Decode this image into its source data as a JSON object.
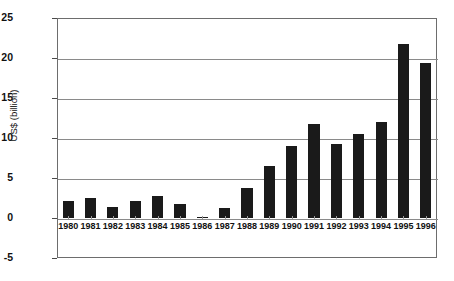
{
  "chart_data": {
    "type": "bar",
    "title": "",
    "xlabel": "",
    "ylabel": "US$ (billion)",
    "ylim": [
      -5,
      25
    ],
    "yticks": [
      25,
      20,
      15,
      10,
      5,
      0,
      -5
    ],
    "ytick_labels": [
      "25",
      "20",
      "15",
      "10",
      "5",
      "0",
      "-5"
    ],
    "grid": true,
    "legend": "none",
    "bar_color": "#1a1a1a",
    "categories": [
      "1980",
      "1981",
      "1982",
      "1983",
      "1984",
      "1985",
      "1986",
      "1987",
      "1988",
      "1989",
      "1990",
      "1991",
      "1992",
      "1993",
      "1994",
      "1995",
      "1996"
    ],
    "values": [
      2.1,
      2.5,
      1.4,
      2.1,
      2.8,
      1.7,
      0.15,
      1.2,
      3.8,
      6.5,
      9.0,
      11.7,
      9.3,
      10.5,
      12.0,
      21.8,
      19.4
    ]
  }
}
